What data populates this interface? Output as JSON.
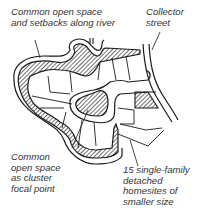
{
  "diagram": {
    "labels": {
      "river_open_space": [
        "Common open space",
        "and setbacks along river"
      ],
      "collector_street": [
        "Collector",
        "street"
      ],
      "focal_open_space": [
        "Common",
        "open space",
        "as cluster",
        "focal point"
      ],
      "homesites": [
        "15 single-family",
        "detached",
        "homesites of",
        "smaller size"
      ]
    },
    "homesite_count": 15,
    "colors": {
      "line": "#1a1a1a",
      "hatch": "#333333",
      "text": "#333333",
      "background": "#ffffff"
    }
  }
}
